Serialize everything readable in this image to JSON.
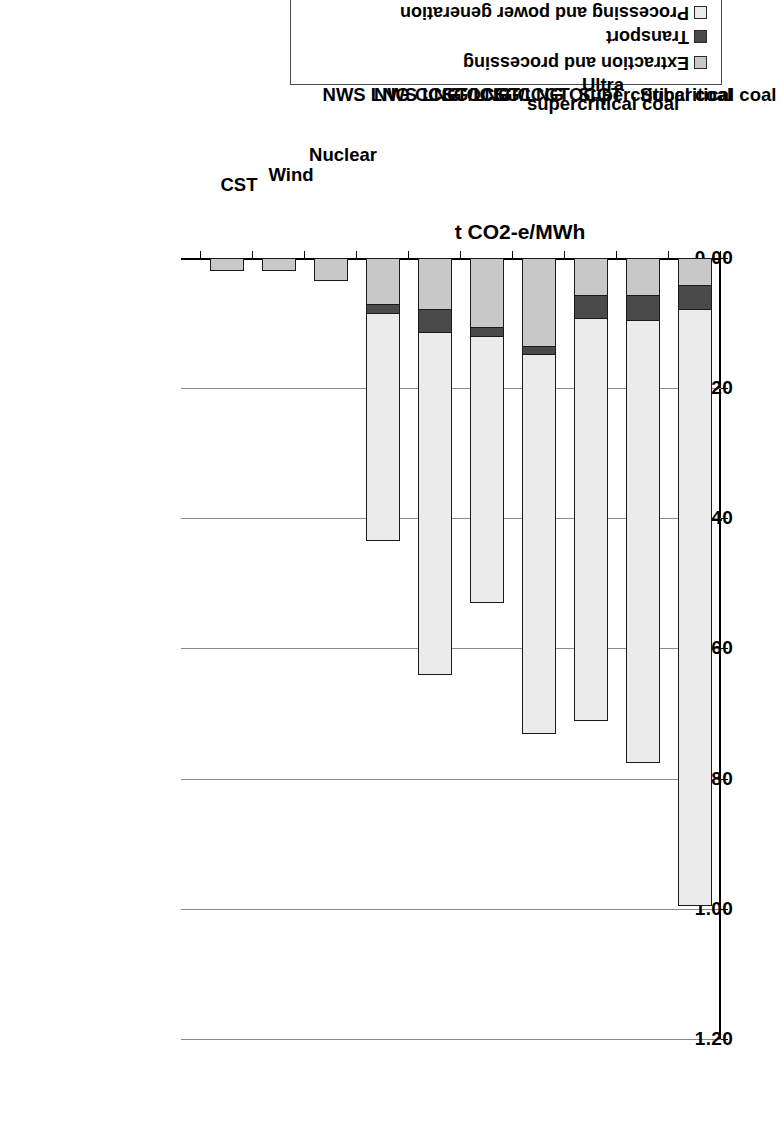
{
  "chart_data": {
    "type": "bar",
    "subtype": "stacked-horizontal",
    "title": "",
    "xlabel": "",
    "ylabel": "t CO2-e/MWh",
    "value_axis_label": "t CO2-e/MWh",
    "ylim": [
      0.0,
      1.2
    ],
    "ticks": [
      "0.00",
      "0.20",
      "0.40",
      "0.60",
      "0.80",
      "1.00",
      "1.20"
    ],
    "tick_values": [
      0.0,
      0.2,
      0.4,
      0.6,
      0.8,
      1.0,
      1.2
    ],
    "grid": true,
    "legend_position": "left",
    "categories": [
      "Subcritical coal",
      "Supercritical coal",
      "Ultra supercritical coal",
      "CSG/LNG  OCGT",
      "CSG/LNG  CCGT",
      "NWS LNG  OCGT",
      "NWS LNG  CCGT",
      "Nuclear",
      "Wind",
      "CST"
    ],
    "series": [
      {
        "name": "Extraction and processing",
        "color": "#c8c8c8",
        "values": [
          0.04,
          0.055,
          0.055,
          0.135,
          0.105,
          0.078,
          0.07,
          0.035,
          0.02,
          0.02
        ]
      },
      {
        "name": "Transport",
        "color": "#4a4a4a",
        "values": [
          0.035,
          0.038,
          0.035,
          0.01,
          0.013,
          0.033,
          0.013,
          0.0,
          0.0,
          0.0
        ]
      },
      {
        "name": "Processing and power generation",
        "color": "#ebebeb",
        "values": [
          0.92,
          0.682,
          0.62,
          0.585,
          0.412,
          0.529,
          0.352,
          0.0,
          0.0,
          0.0
        ]
      }
    ],
    "totals": [
      0.995,
      0.775,
      0.71,
      0.73,
      0.53,
      0.64,
      0.435,
      0.035,
      0.02,
      0.02
    ]
  },
  "legend": {
    "items": [
      {
        "label": "Extraction and processing",
        "color": "#c8c8c8"
      },
      {
        "label": "Transport",
        "color": "#4a4a4a"
      },
      {
        "label": "Processing and power generation",
        "color": "#ebebeb"
      }
    ]
  },
  "axis": {
    "value_title": "t CO2-e/MWh",
    "tick_labels": [
      "0.00",
      "0.20",
      "0.40",
      "0.60",
      "0.80",
      "1.00",
      "1.20"
    ]
  },
  "categories": {
    "c0": "Subcritical coal",
    "c1": "Supercritical coal",
    "c2a": "Ultra",
    "c2b": "supercritical coal",
    "c3": "CSG/LNG  OCGT",
    "c4": "CSG/LNG  CCGT",
    "c5": "NWS LNG  OCGT",
    "c6": "NWS LNG  CCGT",
    "c7": "Nuclear",
    "c8": "Wind",
    "c9": "CST"
  }
}
